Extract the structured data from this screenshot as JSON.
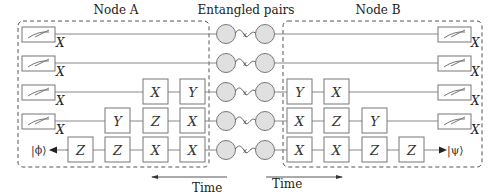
{
  "title_labels": {
    "node_a": "Node A",
    "entangled": "Entangled pairs",
    "node_b": "Node B"
  },
  "time_labels": {
    "left": "Time",
    "right": "Time"
  },
  "measurement_basis": "X",
  "states": {
    "phi": "|ϕ⟩",
    "psi": "|ψ⟩"
  },
  "node_a": {
    "rows": [
      {
        "measure": true,
        "gates": []
      },
      {
        "measure": true,
        "gates": []
      },
      {
        "measure": true,
        "gates": [
          "X",
          "Y"
        ]
      },
      {
        "measure": true,
        "gates": [
          "Y",
          "Z",
          "X"
        ]
      },
      {
        "measure": false,
        "output": "|ϕ⟩",
        "gates": [
          "Z",
          "Z",
          "X",
          "X"
        ]
      }
    ]
  },
  "node_b": {
    "rows": [
      {
        "measure": true,
        "gates": []
      },
      {
        "measure": true,
        "gates": []
      },
      {
        "measure": true,
        "gates": [
          "Y",
          "X"
        ]
      },
      {
        "measure": true,
        "gates": [
          "X",
          "Z",
          "Y"
        ]
      },
      {
        "measure": false,
        "output": "|ψ⟩",
        "gates": [
          "X",
          "X",
          "Z",
          "Z"
        ]
      }
    ]
  },
  "entangled_pairs": 5,
  "gate_labels": {
    "a_r3": [
      "X",
      "Y"
    ],
    "a_r4": [
      "Y",
      "Z",
      "X"
    ],
    "a_r5": [
      "Z",
      "Z",
      "X",
      "X"
    ],
    "b_r3": [
      "Y",
      "X"
    ],
    "b_r4": [
      "X",
      "Z",
      "Y"
    ],
    "b_r5": [
      "X",
      "X",
      "Z",
      "Z"
    ]
  }
}
